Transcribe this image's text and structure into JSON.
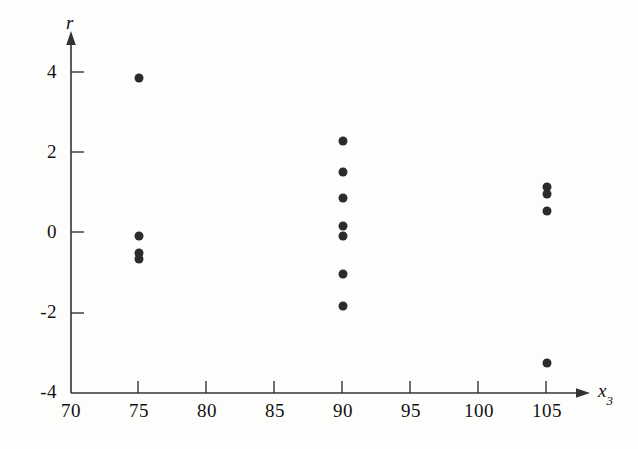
{
  "figure": {
    "background_color": "#fdfdfc",
    "ink_color": "#111111",
    "marker_color": "#2b2b2b"
  },
  "axes": {
    "y_title": "r",
    "x_title_base": "x",
    "x_title_sub": "3"
  },
  "chart_data": {
    "type": "scatter",
    "title": "",
    "xlabel": "x3",
    "ylabel": "r",
    "xlim": [
      70,
      108
    ],
    "ylim": [
      -4.4,
      4.6
    ],
    "xticks": [
      70,
      75,
      80,
      85,
      90,
      95,
      100,
      105
    ],
    "xtick_labels": [
      "70",
      "75",
      "80",
      "85",
      "90",
      "95",
      "100",
      "105"
    ],
    "yticks": [
      -4,
      -2,
      0,
      2,
      4
    ],
    "ytick_labels": [
      "-4",
      "-2",
      "0",
      "2",
      "4"
    ],
    "grid": false,
    "legend": null,
    "series": [
      {
        "name": "residuals",
        "points": [
          {
            "x": 75,
            "y": 3.85
          },
          {
            "x": 75,
            "y": -0.1
          },
          {
            "x": 75,
            "y": -0.52
          },
          {
            "x": 75,
            "y": -0.68
          },
          {
            "x": 90,
            "y": 2.28
          },
          {
            "x": 90,
            "y": 1.5
          },
          {
            "x": 90,
            "y": 0.85
          },
          {
            "x": 90,
            "y": 0.15
          },
          {
            "x": 90,
            "y": -0.1
          },
          {
            "x": 90,
            "y": -1.05
          },
          {
            "x": 90,
            "y": -1.85
          },
          {
            "x": 105,
            "y": 1.12
          },
          {
            "x": 105,
            "y": 0.95
          },
          {
            "x": 105,
            "y": 0.52
          },
          {
            "x": 105,
            "y": -3.28
          }
        ]
      }
    ]
  }
}
